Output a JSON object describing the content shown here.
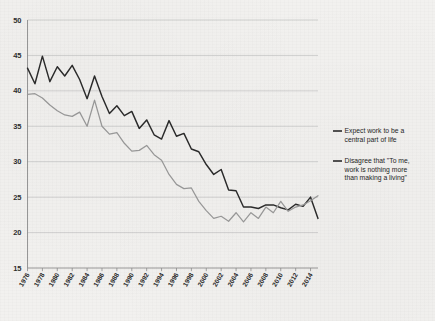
{
  "chart_data": {
    "type": "line",
    "title": "",
    "subtitle": "",
    "xlabel": "",
    "ylabel": "",
    "grid": true,
    "legend_position": "right",
    "xlim": [
      1976,
      2015
    ],
    "ylim": [
      15,
      50
    ],
    "ytick_values": [
      15,
      20,
      25,
      30,
      35,
      40,
      45,
      50
    ],
    "ytick_labels": [
      "15",
      "20",
      "25",
      "30",
      "35",
      "40",
      "45",
      "50"
    ],
    "xtick_values": [
      1976,
      1978,
      1980,
      1982,
      1984,
      1986,
      1988,
      1990,
      1992,
      1994,
      1996,
      1998,
      2000,
      2002,
      2004,
      2006,
      2008,
      2010,
      2012,
      2014
    ],
    "xtick_labels": [
      "1976",
      "1978",
      "1980",
      "1982",
      "1984",
      "1986",
      "1988",
      "1990",
      "1992",
      "1994",
      "1996",
      "1998",
      "2000",
      "2002",
      "2004",
      "2006",
      "2008",
      "2010",
      "2012",
      "2014"
    ],
    "x": [
      1976,
      1977,
      1978,
      1979,
      1980,
      1981,
      1982,
      1983,
      1984,
      1985,
      1986,
      1987,
      1988,
      1989,
      1990,
      1991,
      1992,
      1993,
      1994,
      1995,
      1996,
      1997,
      1998,
      1999,
      2000,
      2001,
      2002,
      2003,
      2004,
      2005,
      2006,
      2007,
      2008,
      2009,
      2010,
      2011,
      2012,
      2013,
      2014,
      2015
    ],
    "series": [
      {
        "name": "Expect work to be a central part of life",
        "color": "#2b2b2b",
        "values": [
          43.2,
          41.0,
          44.9,
          41.3,
          43.4,
          42.1,
          43.6,
          41.6,
          38.9,
          42.1,
          39.2,
          36.8,
          37.9,
          36.5,
          37.1,
          34.7,
          35.9,
          33.8,
          33.2,
          35.8,
          33.6,
          34.0,
          31.8,
          31.4,
          29.6,
          28.2,
          28.9,
          26.0,
          25.9,
          23.6,
          23.6,
          23.4,
          23.9,
          23.9,
          23.5,
          23.2,
          24.0,
          23.7,
          25.0,
          22.0
        ]
      },
      {
        "name": "Disagree that \"To me, work is nothing more than making a living\"",
        "color": "#9a9a9a",
        "values": [
          39.5,
          39.6,
          39.0,
          38.0,
          37.2,
          36.6,
          36.4,
          37.0,
          35.0,
          38.7,
          35.0,
          33.9,
          34.1,
          32.6,
          31.5,
          31.6,
          32.3,
          31.0,
          30.2,
          28.2,
          26.8,
          26.2,
          26.3,
          24.4,
          23.1,
          22.0,
          22.3,
          21.6,
          22.8,
          21.5,
          22.8,
          22.0,
          23.6,
          22.8,
          24.4,
          23.0,
          23.6,
          23.9,
          24.5,
          25.2
        ]
      }
    ]
  },
  "legend": {
    "items": [
      {
        "label_lines": [
          "Expect work to be a",
          "central part of life"
        ],
        "color": "#2b2b2b"
      },
      {
        "label_lines": [
          "Disagree that \"To me,",
          "work is nothing more",
          "than making a living\""
        ],
        "color": "#2b2b2b"
      }
    ]
  },
  "caption": {
    "text": ""
  },
  "colors": {
    "background": "#f2f1ef",
    "axis": "#8c8c8c",
    "grid": "#c3c3c3",
    "series_primary": "#2b2b2b",
    "series_secondary": "#9a9a9a",
    "text": "#2e2e2e"
  }
}
